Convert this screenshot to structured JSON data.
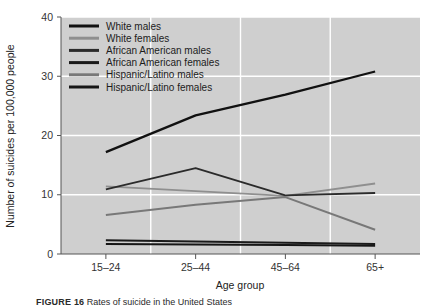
{
  "figure": {
    "background": "#ffffff",
    "plot_background": "#cfcfcf",
    "gridline_color": "#ffffff",
    "axis_color": "#555555",
    "caption_label": "FIGURE 16",
    "caption_text": " Rates of suicide in the United States"
  },
  "chart_data": {
    "type": "line",
    "title": "",
    "xlabel": "Age group",
    "ylabel": "Number of suicides per 100,000 people",
    "categories": [
      "15–24",
      "25–44",
      "45–64",
      "65+"
    ],
    "ylim": [
      0,
      40
    ],
    "yticks": [
      0,
      10,
      20,
      30,
      40
    ],
    "ytick_labels": [
      "0",
      "10",
      "20",
      "30",
      "40"
    ],
    "grid": true,
    "legend_position": "top-left-inside",
    "series": [
      {
        "name": "White males",
        "color": "#111111",
        "width": 2.3,
        "values": [
          17.2,
          23.4,
          26.9,
          30.8
        ]
      },
      {
        "name": "White females",
        "color": "#8f8f8f",
        "width": 1.8,
        "values": [
          11.4,
          10.6,
          9.8,
          11.9
        ]
      },
      {
        "name": "African American males",
        "color": "#2b2b2b",
        "width": 1.9,
        "values": [
          10.9,
          14.5,
          9.9,
          10.3
        ]
      },
      {
        "name": "African American females",
        "color": "#1a1a1a",
        "width": 2.0,
        "values": [
          2.3,
          2.1,
          1.9,
          1.7
        ]
      },
      {
        "name": "Hispanic/Latino males",
        "color": "#787878",
        "width": 2.0,
        "values": [
          6.6,
          8.3,
          9.6,
          4.1
        ]
      },
      {
        "name": "Hispanic/Latino females",
        "color": "#161616",
        "width": 2.0,
        "values": [
          1.7,
          1.6,
          1.5,
          1.4
        ]
      }
    ]
  },
  "legend": {
    "items": [
      {
        "label": "White males",
        "color": "#111111"
      },
      {
        "label": "White females",
        "color": "#8f8f8f"
      },
      {
        "label": "African American males",
        "color": "#2b2b2b"
      },
      {
        "label": "African American females",
        "color": "#1a1a1a"
      },
      {
        "label": "Hispanic/Latino males",
        "color": "#787878"
      },
      {
        "label": "Hispanic/Latino females",
        "color": "#161616"
      }
    ]
  }
}
